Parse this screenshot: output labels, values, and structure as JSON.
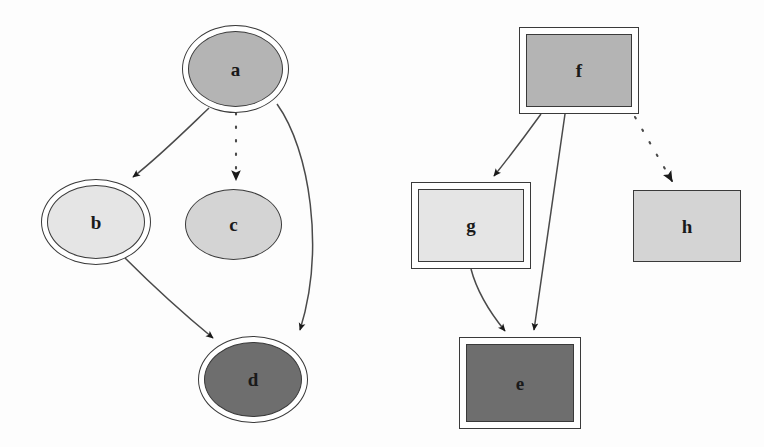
{
  "diagram": {
    "background_color": "#fdfdfd",
    "stroke_color": "#3a3a3a",
    "label_color": "#1a1a1a",
    "arrow_color": "#1a1a1a",
    "fills": {
      "medium_gray": "#b4b4b4",
      "light_gray": "#d4d4d4",
      "very_light_gray": "#e5e5e5",
      "dark_gray": "#6e6e6e"
    },
    "clusters": [
      {
        "name": "ellipse-cluster",
        "shape": "ellipse",
        "nodes": [
          "a",
          "b",
          "c",
          "d"
        ]
      },
      {
        "name": "box-cluster",
        "shape": "box",
        "nodes": [
          "f",
          "g",
          "h",
          "e"
        ]
      }
    ],
    "nodes": [
      {
        "id": "a",
        "label": "a",
        "shape": "ellipse",
        "peripheries": 2,
        "fill": "#b4b4b4",
        "x": 182,
        "y": 25,
        "w": 107,
        "h": 88
      },
      {
        "id": "b",
        "label": "b",
        "shape": "ellipse",
        "peripheries": 2,
        "fill": "#e5e5e5",
        "x": 41,
        "y": 179,
        "w": 110,
        "h": 86
      },
      {
        "id": "c",
        "label": "c",
        "shape": "ellipse",
        "peripheries": 1,
        "fill": "#d4d4d4",
        "x": 185,
        "y": 189,
        "w": 97,
        "h": 71
      },
      {
        "id": "d",
        "label": "d",
        "shape": "ellipse",
        "peripheries": 2,
        "fill": "#6e6e6e",
        "x": 198,
        "y": 336,
        "w": 110,
        "h": 87
      },
      {
        "id": "f",
        "label": "f",
        "shape": "box",
        "peripheries": 2,
        "fill": "#b4b4b4",
        "x": 519,
        "y": 27,
        "w": 120,
        "h": 87
      },
      {
        "id": "g",
        "label": "g",
        "shape": "box",
        "peripheries": 2,
        "fill": "#e5e5e5",
        "x": 411,
        "y": 182,
        "w": 120,
        "h": 87
      },
      {
        "id": "h",
        "label": "h",
        "shape": "box",
        "peripheries": 1,
        "fill": "#d4d4d4",
        "x": 633,
        "y": 190,
        "w": 108,
        "h": 72
      },
      {
        "id": "e",
        "label": "e",
        "shape": "box",
        "peripheries": 2,
        "fill": "#6e6e6e",
        "x": 459,
        "y": 337,
        "w": 122,
        "h": 92
      }
    ],
    "edges": [
      {
        "id": "a-b",
        "from": "a",
        "to": "b",
        "style": "solid",
        "arrowhead": "normal"
      },
      {
        "id": "a-c",
        "from": "a",
        "to": "c",
        "style": "dotted",
        "arrowhead": "normal"
      },
      {
        "id": "a-d",
        "from": "a",
        "to": "d",
        "style": "solid",
        "arrowhead": "normal"
      },
      {
        "id": "b-d",
        "from": "b",
        "to": "d",
        "style": "solid",
        "arrowhead": "normal"
      },
      {
        "id": "f-g",
        "from": "f",
        "to": "g",
        "style": "solid",
        "arrowhead": "normal"
      },
      {
        "id": "f-e",
        "from": "f",
        "to": "e",
        "style": "solid",
        "arrowhead": "normal"
      },
      {
        "id": "f-h",
        "from": "f",
        "to": "h",
        "style": "dotted",
        "arrowhead": "normal"
      },
      {
        "id": "g-e",
        "from": "g",
        "to": "e",
        "style": "solid",
        "arrowhead": "normal"
      }
    ]
  }
}
